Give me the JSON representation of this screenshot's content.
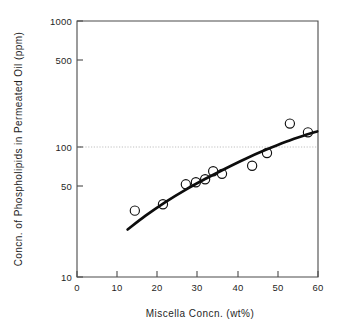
{
  "chart_data": {
    "type": "scatter",
    "title": "",
    "xlabel": "Miscella Concn. (wt%)",
    "ylabel": "Concn. of Phospholipids in Permeated Oil (ppm)",
    "xlim": [
      0,
      60
    ],
    "ylim": [
      10,
      1000
    ],
    "yscale": "log",
    "xscale": "linear",
    "grid": "horizontal dotted gridline at y = 100 only",
    "legend": "none",
    "xticks": [
      "0",
      "10",
      "20",
      "30",
      "40",
      "50",
      "60"
    ],
    "xtick_values": [
      0,
      10,
      20,
      30,
      40,
      50,
      60
    ],
    "yticks": [
      "10",
      "50",
      "100",
      "500",
      "1000"
    ],
    "ytick_values": [
      10,
      50,
      100,
      500,
      1000
    ],
    "marker_style": "open circle",
    "series": [
      {
        "name": "Permeated oil phospholipid concentration",
        "x": [
          14.4,
          21.4,
          27.1,
          29.6,
          31.9,
          33.9,
          36.1,
          43.6,
          47.3,
          53.0,
          57.5
        ],
        "y": [
          33,
          37,
          53,
          55,
          58,
          67,
          64,
          74,
          93,
          158,
          135
        ]
      }
    ],
    "fit_curve": {
      "name": "trend line",
      "x": [
        12.6,
        17.0,
        22.0,
        27.0,
        32.0,
        37.0,
        42.0,
        47.0,
        52.0,
        57.0,
        59.8
      ],
      "y": [
        23.5,
        30.0,
        38.5,
        48.0,
        58.5,
        70.5,
        84.0,
        98.5,
        114.0,
        129.0,
        137.0
      ]
    },
    "annotations": []
  },
  "axes": {
    "x_title": "Miscella Concn. (wt%)",
    "y_title": "Concn. of Phospholipids in Permeated Oil (ppm)"
  },
  "colors": {
    "background": "#ffffff",
    "axis": "#4a4a4a",
    "marker": "#111111",
    "curve": "#0d0d0d",
    "gridline": "#b9b9b9",
    "text": "#1f1f1f"
  }
}
